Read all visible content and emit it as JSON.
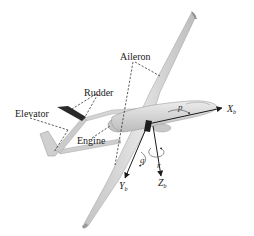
{
  "figure": {
    "labels": {
      "aileron": "Aileron",
      "rudder": "Rudder",
      "elevator": "Elevator",
      "engine": "Engine"
    },
    "axes": {
      "x": {
        "main": "X",
        "sub": "b"
      },
      "y": {
        "main": "Y",
        "sub": "b"
      },
      "z": {
        "main": "Z",
        "sub": "b"
      }
    },
    "rates": {
      "roll": "p",
      "pitch": "q",
      "yaw": "r"
    },
    "colors": {
      "airframe": "#d9d9d9",
      "airframe_shade": "#b8b8b8",
      "dark_fin": "#2a2a2a",
      "ink": "#1a1a1a"
    }
  }
}
